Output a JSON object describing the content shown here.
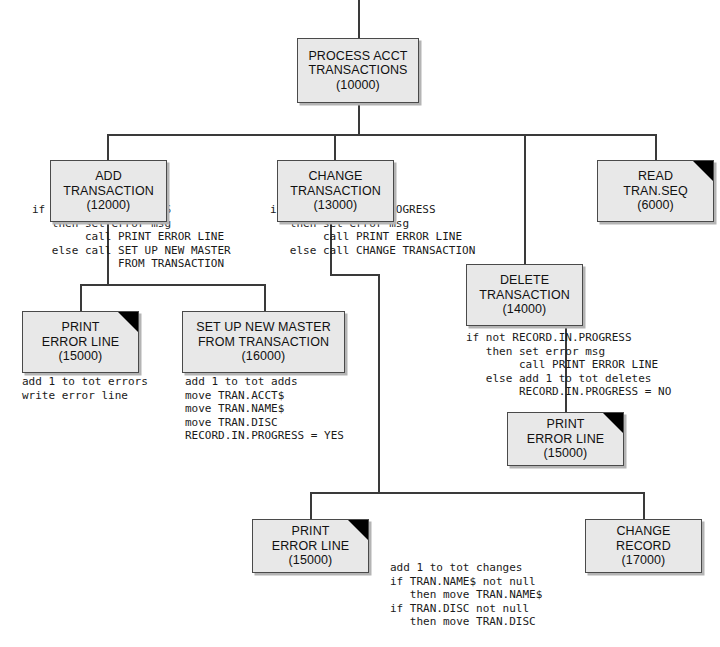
{
  "diagram": {
    "colors": {
      "box_fill": "#e8e8e8",
      "box_border": "#4a4a4a",
      "box_shadow": "#b4b4b4",
      "line": "#3a3a3a",
      "corner_flag": "#000000",
      "text": "#111111"
    }
  },
  "modules": {
    "process_acct": {
      "line1": "PROCESS ACCT",
      "line2": "TRANSACTIONS",
      "number": "(10000)",
      "flagged": false
    },
    "add_transaction": {
      "line1": "ADD",
      "line2": "TRANSACTION",
      "number": "(12000)",
      "flagged": false
    },
    "change_transaction": {
      "line1": "CHANGE",
      "line2": "TRANSACTION",
      "number": "(13000)",
      "flagged": false
    },
    "read_tran_seq": {
      "line1": "READ",
      "line2": "TRAN.SEQ",
      "number": "(6000)",
      "flagged": true
    },
    "delete_transaction": {
      "line1": "DELETE",
      "line2": "TRANSACTION",
      "number": "(14000)",
      "flagged": false
    },
    "print_error_line_add": {
      "line1": "PRINT",
      "line2": "ERROR LINE",
      "number": "(15000)",
      "flagged": true
    },
    "set_up_new_master": {
      "line1": "SET UP NEW MASTER",
      "line2": "FROM TRANSACTION",
      "number": "(16000)",
      "flagged": false
    },
    "print_error_line_delete": {
      "line1": "PRINT",
      "line2": "ERROR LINE",
      "number": "(15000)",
      "flagged": true
    },
    "print_error_line_change": {
      "line1": "PRINT",
      "line2": "ERROR LINE",
      "number": "(15000)",
      "flagged": true
    },
    "change_record": {
      "line1": "CHANGE",
      "line2": "RECORD",
      "number": "(17000)",
      "flagged": false
    }
  },
  "pseudocode": {
    "add_transaction": "if RECORD.IN.PROGRESS\n   then set error msg\n        call PRINT ERROR LINE\n   else call SET UP NEW MASTER\n             FROM TRANSACTION",
    "change_transaction": "if not RECORD.IN.PROGRESS\n   then set error msg\n        call PRINT ERROR LINE\n   else call CHANGE TRANSACTION",
    "delete_transaction": "if not RECORD.IN.PROGRESS\n   then set error msg\n        call PRINT ERROR LINE\n   else add 1 to tot deletes\n        RECORD.IN.PROGRESS = NO",
    "print_error_line_add": "add 1 to tot errors\nwrite error line",
    "set_up_new_master": "add 1 to tot adds\nmove TRAN.ACCT$\nmove TRAN.NAME$\nmove TRAN.DISC\nRECORD.IN.PROGRESS = YES",
    "change_record": "add 1 to tot changes\nif TRAN.NAME$ not null\n   then move TRAN.NAME$\nif TRAN.DISC not null\n   then move TRAN.DISC"
  }
}
